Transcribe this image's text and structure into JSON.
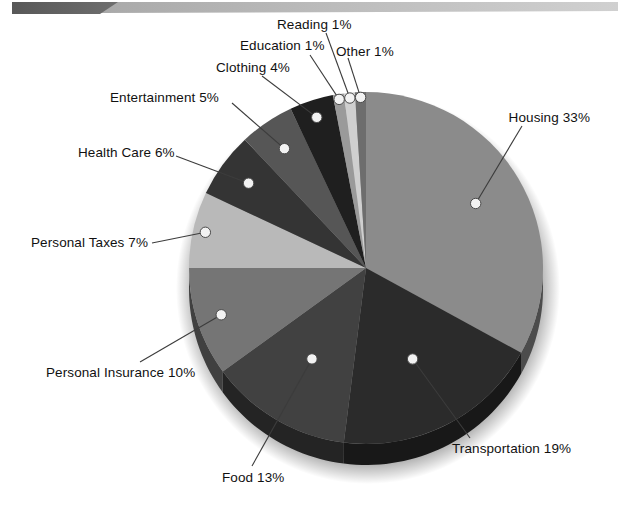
{
  "banner": {
    "dark_shape_color": "#636363",
    "light_bar_color": "#b5b5b5",
    "label": "decorative-header-band"
  },
  "chart_data": {
    "type": "pie",
    "title": "",
    "subtitle": "",
    "xlabel": "",
    "ylabel": "",
    "legend_position": "callout-labels",
    "grid": false,
    "units": "percent",
    "total": 100,
    "start_angle_deg": -90,
    "direction": "clockwise",
    "categories": [
      "Housing",
      "Transportation",
      "Food",
      "Personal Insurance",
      "Personal Taxes",
      "Health Care",
      "Entertainment",
      "Clothing",
      "Education",
      "Reading",
      "Other"
    ],
    "values": [
      33,
      19,
      13,
      10,
      7,
      6,
      5,
      4,
      1,
      1,
      1
    ],
    "colors": [
      "#8b8b8b",
      "#2b2b2b",
      "#414141",
      "#757575",
      "#b9b9b9",
      "#343434",
      "#565656",
      "#1f1f1f",
      "#9a9a9a",
      "#cfcfcf",
      "#6d6d6d"
    ],
    "slices": [
      {
        "label": "Housing",
        "value": 33,
        "display": "Housing 33%",
        "color": "#8b8b8b"
      },
      {
        "label": "Transportation",
        "value": 19,
        "display": "Transportation 19%",
        "color": "#2b2b2b"
      },
      {
        "label": "Food",
        "value": 13,
        "display": "Food 13%",
        "color": "#414141"
      },
      {
        "label": "Personal Insurance",
        "value": 10,
        "display": "Personal Insurance 10%",
        "color": "#757575"
      },
      {
        "label": "Personal Taxes",
        "value": 7,
        "display": "Personal Taxes 7%",
        "color": "#b9b9b9"
      },
      {
        "label": "Health Care",
        "value": 6,
        "display": "Health Care 6%",
        "color": "#343434"
      },
      {
        "label": "Entertainment",
        "value": 5,
        "display": "Entertainment 5%",
        "color": "#565656"
      },
      {
        "label": "Clothing",
        "value": 4,
        "display": "Clothing 4%",
        "color": "#1f1f1f"
      },
      {
        "label": "Education",
        "value": 1,
        "display": "Education 1%",
        "color": "#9a9a9a"
      },
      {
        "label": "Reading",
        "value": 1,
        "display": "Reading 1%",
        "color": "#cfcfcf"
      },
      {
        "label": "Other",
        "value": 1,
        "display": "Other 1%",
        "color": "#6d6d6d"
      }
    ]
  },
  "labels": {
    "housing": "Housing 33%",
    "transportation": "Transportation 19%",
    "food": "Food 13%",
    "personal_insurance": "Personal Insurance 10%",
    "personal_taxes": "Personal Taxes 7%",
    "health_care": "Health Care 6%",
    "entertainment": "Entertainment 5%",
    "clothing": "Clothing 4%",
    "education": "Education 1%",
    "reading": "Reading 1%",
    "other": "Other 1%"
  },
  "style": {
    "pie_center_x": 366,
    "pie_center_y": 268,
    "pie_rx": 177,
    "pie_ry": 176,
    "pie_depth": 21,
    "marker_fill": "#f2f2f2",
    "marker_stroke": "#4a4a4a",
    "leader_color": "#3c3c3c",
    "background": "#ffffff"
  }
}
